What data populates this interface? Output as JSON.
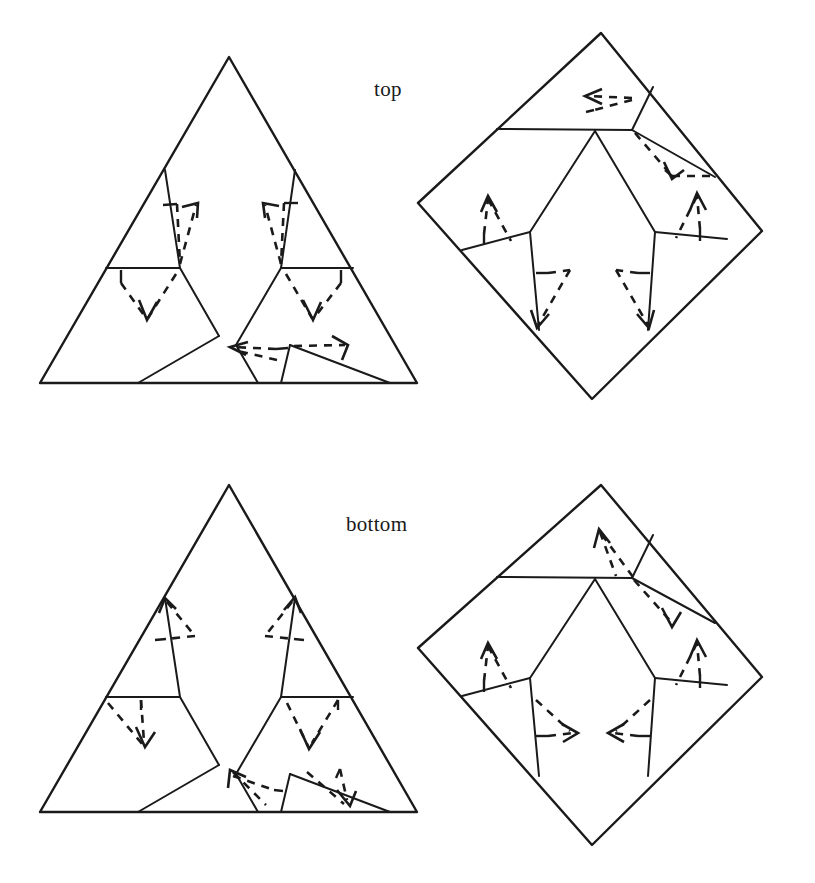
{
  "figure": {
    "title": "",
    "background_color": "#ffffff",
    "line_color": "#1a1a1a",
    "panels": [
      {
        "id": "top-left",
        "shape": "triangle",
        "label": "",
        "arrow_count": 4
      },
      {
        "id": "top-right",
        "shape": "diamond",
        "label": "",
        "arrow_count": 6
      },
      {
        "id": "bottom-left",
        "shape": "triangle",
        "label": "",
        "arrow_count": 6
      },
      {
        "id": "bottom-right",
        "shape": "diamond",
        "label": "",
        "arrow_count": 6
      }
    ]
  },
  "labels": {
    "top": "top",
    "bottom": "bottom"
  },
  "geometry": {
    "triangle_top": {
      "apex": [
        229,
        57
      ],
      "left": [
        40,
        383
      ],
      "right": [
        417,
        383
      ]
    },
    "triangle_bottom": {
      "apex": [
        229,
        485
      ],
      "left": [
        40,
        812
      ],
      "right": [
        417,
        812
      ]
    },
    "diamond_top": {
      "top": [
        601,
        33
      ],
      "left": [
        418,
        203
      ],
      "right": [
        762,
        231
      ],
      "bottom": [
        592,
        399
      ]
    },
    "diamond_bottom": {
      "top": [
        601,
        485
      ],
      "left": [
        418,
        648
      ],
      "right": [
        762,
        677
      ],
      "bottom": [
        592,
        845
      ]
    }
  }
}
